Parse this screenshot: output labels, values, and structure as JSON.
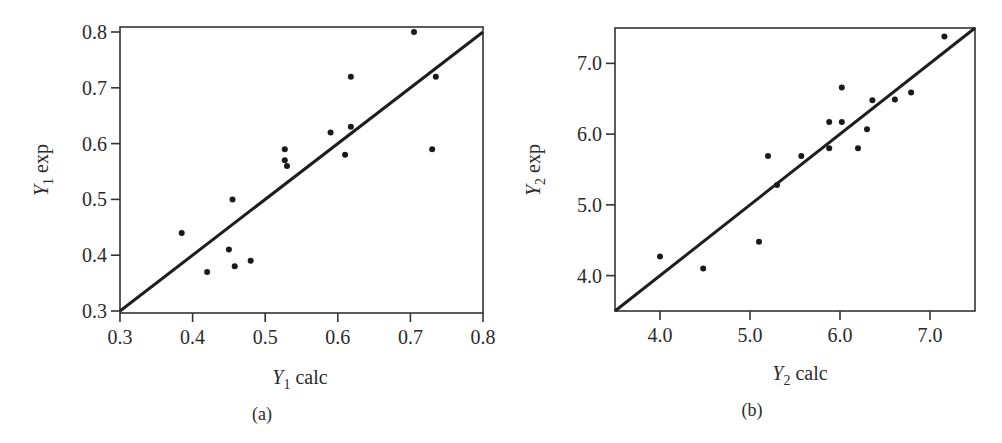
{
  "chart_data": [
    {
      "type": "scatter",
      "panel": "(a)",
      "xlabel": "Y1 calc",
      "xlabel_main": "Y",
      "xlabel_sub": "1",
      "xlabel_rest": " calc",
      "ylabel": "Y1 exp",
      "ylabel_main": "Y",
      "ylabel_sub": "1",
      "ylabel_rest": " exp",
      "xlim": [
        0.3,
        0.8
      ],
      "ylim": [
        0.3,
        0.8
      ],
      "xticks": [
        "0.3",
        "0.4",
        "0.5",
        "0.6",
        "0.7",
        "0.8"
      ],
      "yticks": [
        "0.3",
        "0.4",
        "0.5",
        "0.6",
        "0.7",
        "0.8"
      ],
      "grid": false,
      "fit_line": {
        "x": [
          0.3,
          0.8
        ],
        "y": [
          0.3,
          0.8
        ]
      },
      "points": [
        {
          "x": 0.385,
          "y": 0.44
        },
        {
          "x": 0.42,
          "y": 0.37
        },
        {
          "x": 0.45,
          "y": 0.41
        },
        {
          "x": 0.455,
          "y": 0.5
        },
        {
          "x": 0.458,
          "y": 0.38
        },
        {
          "x": 0.48,
          "y": 0.39
        },
        {
          "x": 0.527,
          "y": 0.59
        },
        {
          "x": 0.527,
          "y": 0.57
        },
        {
          "x": 0.53,
          "y": 0.56
        },
        {
          "x": 0.59,
          "y": 0.62
        },
        {
          "x": 0.61,
          "y": 0.58
        },
        {
          "x": 0.618,
          "y": 0.63
        },
        {
          "x": 0.618,
          "y": 0.72
        },
        {
          "x": 0.705,
          "y": 0.8
        },
        {
          "x": 0.73,
          "y": 0.59
        },
        {
          "x": 0.735,
          "y": 0.72
        }
      ]
    },
    {
      "type": "scatter",
      "panel": "(b)",
      "xlabel": "Y2 calc",
      "xlabel_main": "Y",
      "xlabel_sub": "2",
      "xlabel_rest": " calc",
      "ylabel": "Y2 exp",
      "ylabel_main": "Y",
      "ylabel_sub": "2",
      "ylabel_rest": " exp",
      "xlim": [
        3.5,
        7.5
      ],
      "ylim": [
        3.5,
        7.5
      ],
      "xticks": [
        "4.0",
        "5.0",
        "6.0",
        "7.0"
      ],
      "yticks": [
        "4.0",
        "5.0",
        "6.0",
        "7.0"
      ],
      "grid": false,
      "fit_line": {
        "x": [
          3.5,
          7.5
        ],
        "y": [
          3.5,
          7.5
        ]
      },
      "points": [
        {
          "x": 4.0,
          "y": 4.27
        },
        {
          "x": 4.48,
          "y": 4.1
        },
        {
          "x": 5.1,
          "y": 4.48
        },
        {
          "x": 5.2,
          "y": 5.69
        },
        {
          "x": 5.3,
          "y": 5.28
        },
        {
          "x": 5.57,
          "y": 5.69
        },
        {
          "x": 5.88,
          "y": 6.17
        },
        {
          "x": 5.88,
          "y": 5.8
        },
        {
          "x": 6.02,
          "y": 6.17
        },
        {
          "x": 6.02,
          "y": 6.66
        },
        {
          "x": 6.2,
          "y": 5.8
        },
        {
          "x": 6.3,
          "y": 6.07
        },
        {
          "x": 6.36,
          "y": 6.48
        },
        {
          "x": 6.61,
          "y": 6.49
        },
        {
          "x": 6.79,
          "y": 6.59
        },
        {
          "x": 7.16,
          "y": 7.38
        }
      ]
    }
  ]
}
